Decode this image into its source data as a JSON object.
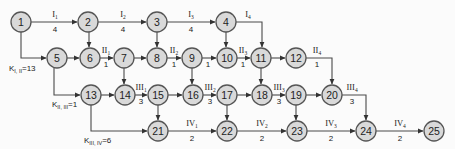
{
  "diagram": {
    "type": "network-graph",
    "background": "#fbfbfb",
    "node_fill": "#d9d9d9",
    "node_stroke": "#555555",
    "edge_color": "#4a4a4a",
    "nodes": [
      {
        "id": "1",
        "x": 21,
        "y": 22
      },
      {
        "id": "2",
        "x": 88,
        "y": 22
      },
      {
        "id": "3",
        "x": 157,
        "y": 22
      },
      {
        "id": "4",
        "x": 226,
        "y": 22
      },
      {
        "id": "5",
        "x": 57,
        "y": 58
      },
      {
        "id": "6",
        "x": 90,
        "y": 58
      },
      {
        "id": "7",
        "x": 124,
        "y": 58
      },
      {
        "id": "8",
        "x": 157,
        "y": 58
      },
      {
        "id": "9",
        "x": 192,
        "y": 58
      },
      {
        "id": "10",
        "x": 227,
        "y": 58
      },
      {
        "id": "11",
        "x": 261,
        "y": 58
      },
      {
        "id": "12",
        "x": 296,
        "y": 58
      },
      {
        "id": "13",
        "x": 91,
        "y": 95
      },
      {
        "id": "14",
        "x": 125,
        "y": 95
      },
      {
        "id": "15",
        "x": 158,
        "y": 95
      },
      {
        "id": "16",
        "x": 193,
        "y": 95
      },
      {
        "id": "17",
        "x": 227,
        "y": 95
      },
      {
        "id": "18",
        "x": 262,
        "y": 95
      },
      {
        "id": "19",
        "x": 296,
        "y": 95
      },
      {
        "id": "20",
        "x": 332,
        "y": 95
      },
      {
        "id": "21",
        "x": 158,
        "y": 131
      },
      {
        "id": "22",
        "x": 227,
        "y": 131
      },
      {
        "id": "23",
        "x": 297,
        "y": 131
      },
      {
        "id": "24",
        "x": 366,
        "y": 131
      },
      {
        "id": "25",
        "x": 434,
        "y": 131
      }
    ],
    "edges": [
      {
        "from": "1",
        "to": "2",
        "label_main": "I",
        "label_sub": "1",
        "duration": "4"
      },
      {
        "from": "2",
        "to": "3",
        "label_main": "I",
        "label_sub": "2",
        "duration": "4"
      },
      {
        "from": "3",
        "to": "4",
        "label_main": "I",
        "label_sub": "3",
        "duration": "4"
      },
      {
        "from": "4",
        "to": "11",
        "label_main": "I",
        "label_sub": "4",
        "duration": ""
      },
      {
        "from": "1",
        "to": "5",
        "label_main": "",
        "label_sub": "",
        "duration": ""
      },
      {
        "from": "2",
        "to": "6",
        "label_main": "",
        "label_sub": "",
        "duration": ""
      },
      {
        "from": "3",
        "to": "8",
        "label_main": "",
        "label_sub": "",
        "duration": ""
      },
      {
        "from": "4",
        "to": "10",
        "label_main": "",
        "label_sub": "",
        "duration": ""
      },
      {
        "from": "5",
        "to": "6",
        "label_main": "",
        "label_sub": "",
        "duration": ""
      },
      {
        "from": "6",
        "to": "7",
        "label_main": "II",
        "label_sub": "1",
        "duration": "1"
      },
      {
        "from": "7",
        "to": "8",
        "label_main": "",
        "label_sub": "",
        "duration": ""
      },
      {
        "from": "8",
        "to": "9",
        "label_main": "II",
        "label_sub": "2",
        "duration": "1"
      },
      {
        "from": "9",
        "to": "10",
        "label_main": "",
        "label_sub": "",
        "duration": "1"
      },
      {
        "from": "10",
        "to": "11",
        "label_main": "II",
        "label_sub": "3",
        "duration": "1"
      },
      {
        "from": "11",
        "to": "12",
        "label_main": "",
        "label_sub": "",
        "duration": ""
      },
      {
        "from": "12",
        "to": "20",
        "label_main": "II",
        "label_sub": "4",
        "duration": "1"
      },
      {
        "from": "5",
        "to": "13",
        "label_main": "",
        "label_sub": "",
        "duration": ""
      },
      {
        "from": "7",
        "to": "14",
        "label_main": "",
        "label_sub": "",
        "duration": ""
      },
      {
        "from": "9",
        "to": "16",
        "label_main": "",
        "label_sub": "",
        "duration": ""
      },
      {
        "from": "11",
        "to": "18",
        "label_main": "",
        "label_sub": "",
        "duration": ""
      },
      {
        "from": "13",
        "to": "14",
        "label_main": "",
        "label_sub": "",
        "duration": ""
      },
      {
        "from": "14",
        "to": "15",
        "label_main": "III",
        "label_sub": "1",
        "duration": "3"
      },
      {
        "from": "15",
        "to": "16",
        "label_main": "",
        "label_sub": "",
        "duration": ""
      },
      {
        "from": "16",
        "to": "17",
        "label_main": "III",
        "label_sub": "2",
        "duration": "3"
      },
      {
        "from": "17",
        "to": "18",
        "label_main": "",
        "label_sub": "",
        "duration": ""
      },
      {
        "from": "18",
        "to": "19",
        "label_main": "III",
        "label_sub": "3",
        "duration": "3"
      },
      {
        "from": "19",
        "to": "20",
        "label_main": "",
        "label_sub": "",
        "duration": ""
      },
      {
        "from": "20",
        "to": "24",
        "label_main": "III",
        "label_sub": "4",
        "duration": "3"
      },
      {
        "from": "13",
        "to": "21",
        "label_main": "",
        "label_sub": "",
        "duration": ""
      },
      {
        "from": "15",
        "to": "21",
        "label_main": "",
        "label_sub": "",
        "duration": ""
      },
      {
        "from": "17",
        "to": "22",
        "label_main": "",
        "label_sub": "",
        "duration": ""
      },
      {
        "from": "19",
        "to": "23",
        "label_main": "",
        "label_sub": "",
        "duration": ""
      },
      {
        "from": "21",
        "to": "22",
        "label_main": "IV",
        "label_sub": "1",
        "duration": "2"
      },
      {
        "from": "22",
        "to": "23",
        "label_main": "IV",
        "label_sub": "2",
        "duration": "2"
      },
      {
        "from": "23",
        "to": "24",
        "label_main": "IV",
        "label_sub": "3",
        "duration": "2"
      },
      {
        "from": "24",
        "to": "25",
        "label_main": "IV",
        "label_sub": "4",
        "duration": "2"
      }
    ],
    "k_labels": [
      {
        "main": "K",
        "sub": "I, II",
        "value": "=13"
      },
      {
        "main": "K",
        "sub": "II, III",
        "value": "=1"
      },
      {
        "main": "K",
        "sub": "III, IV",
        "value": "=6"
      }
    ]
  }
}
